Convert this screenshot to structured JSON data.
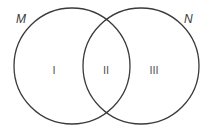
{
  "diagram": {
    "type": "venn",
    "sets": [
      {
        "name": "M",
        "label": "M",
        "cx": 72,
        "cy": 66,
        "r": 58
      },
      {
        "name": "N",
        "label": "N",
        "cx": 141,
        "cy": 66,
        "r": 58
      }
    ],
    "regions": [
      {
        "id": "I",
        "label": "I",
        "description": "M only",
        "x": 54,
        "y": 74
      },
      {
        "id": "II",
        "label": "II",
        "description": "M and N",
        "x": 106,
        "y": 74
      },
      {
        "id": "III",
        "label": "III",
        "description": "N only",
        "x": 154,
        "y": 74
      }
    ],
    "colors": {
      "stroke": "#3a3a3a",
      "text": "#555555"
    }
  }
}
